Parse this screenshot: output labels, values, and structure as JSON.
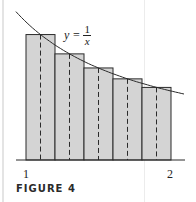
{
  "chart_data": {
    "type": "bar",
    "title": "",
    "function_label": "y = 1/x",
    "x_interval": [
      1,
      2
    ],
    "n": 5,
    "left_edges": [
      1.0,
      1.2,
      1.4,
      1.6,
      1.8
    ],
    "midpoints": [
      1.1,
      1.3,
      1.5,
      1.7,
      1.9
    ],
    "values": [
      0.909,
      0.769,
      0.667,
      0.588,
      0.526
    ],
    "xtick_labels": [
      "1",
      "2"
    ],
    "xlabel": "",
    "ylabel": "",
    "grid": false,
    "legend": null
  },
  "labels": {
    "eq_y": "y =",
    "eq_num": "1",
    "eq_den": "x",
    "tick_1": "1",
    "tick_2": "2",
    "caption": "FIGURE 4"
  },
  "colors": {
    "bar_fill": "#d4d4d4",
    "bar_stroke": "#2b2b2b",
    "curve": "#2b2b2b"
  }
}
